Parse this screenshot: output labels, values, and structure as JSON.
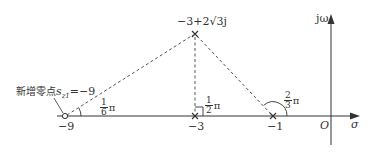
{
  "diagram": {
    "type": "root-locus-angle-diagram",
    "axes": {
      "real_axis_label": "σ",
      "imag_axis_label": "jω",
      "origin_label": "O"
    },
    "points": [
      {
        "id": "zero",
        "kind": "zero",
        "value": -9,
        "tick_label": "−9"
      },
      {
        "id": "pole_real_3",
        "kind": "pole",
        "value": -3,
        "tick_label": "−3"
      },
      {
        "id": "pole_real_1",
        "kind": "pole",
        "value": -1,
        "tick_label": "−1"
      },
      {
        "id": "pole_complex",
        "kind": "pole",
        "value": "-3+2√3j",
        "label": "−3+2√3j"
      }
    ],
    "annotation": {
      "text_cn": "新增零点",
      "symbol": "s",
      "subscript": "z1",
      "eq": "=−9"
    },
    "angles": [
      {
        "at": "zero",
        "num": "1",
        "den": "6",
        "unit": "π"
      },
      {
        "at": "pole_real_3",
        "num": "1",
        "den": "2",
        "unit": "π"
      },
      {
        "at": "pole_real_1",
        "num": "2",
        "den": "3",
        "unit": "π"
      }
    ]
  },
  "colors": {
    "line": "#333333",
    "dashed": "#555555",
    "background": "#ffffff"
  }
}
